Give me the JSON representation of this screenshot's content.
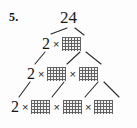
{
  "problem": {
    "number_label": "5.",
    "root_value": "24"
  },
  "symbols": {
    "times": "×",
    "blank": "blank-answer-box"
  },
  "levels": [
    {
      "id": "level-2",
      "terms": [
        "2",
        "blank"
      ]
    },
    {
      "id": "level-3",
      "terms": [
        "2",
        "blank",
        "blank"
      ]
    },
    {
      "id": "level-4",
      "terms": [
        "2",
        "blank",
        "blank",
        "blank"
      ]
    }
  ],
  "colors": {
    "ink": "#1a1a1a",
    "paper": "#fdfdfd",
    "box_fill": "#f2f2f2",
    "box_hatch": "#5a5a5a",
    "line": "#2b2b2b"
  },
  "branches": [
    {
      "name": "root-to-left-2",
      "x1": 67,
      "y1": 28,
      "x2": 51,
      "y2": 34
    },
    {
      "name": "root-to-right-box",
      "x1": 75,
      "y1": 28,
      "x2": 84,
      "y2": 35
    },
    {
      "name": "lvl2-2-to-lvl3-2",
      "x1": 45,
      "y1": 52,
      "x2": 35,
      "y2": 64
    },
    {
      "name": "lvl2-box-to-lvl3-box-a",
      "x1": 80,
      "y1": 52,
      "x2": 67,
      "y2": 64
    },
    {
      "name": "lvl2-box-to-lvl3-box-b",
      "x1": 86,
      "y1": 52,
      "x2": 101,
      "y2": 64
    },
    {
      "name": "lvl3-2-to-lvl4-2",
      "x1": 30,
      "y1": 82,
      "x2": 19,
      "y2": 97
    },
    {
      "name": "lvl3-boxa-to-lvl4-boxa",
      "x1": 64,
      "y1": 82,
      "x2": 52,
      "y2": 97
    },
    {
      "name": "lvl3-boxb-to-lvl4-boxb",
      "x1": 98,
      "y1": 82,
      "x2": 85,
      "y2": 97
    },
    {
      "name": "lvl3-boxb-to-lvl4-boxc",
      "x1": 104,
      "y1": 82,
      "x2": 119,
      "y2": 97
    }
  ]
}
